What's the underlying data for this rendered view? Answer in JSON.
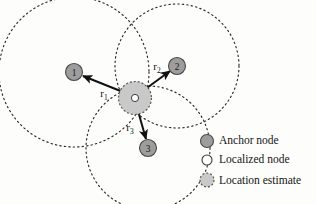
{
  "figure": {
    "background_color": "#fdfdfc"
  },
  "colors": {
    "anchor_fill": "#9d9d9d",
    "anchor_stroke": "#4a4a4a",
    "estimate_fill": "#c9c9c9",
    "estimate_stroke": "#555555",
    "localized_fill": "#ffffff",
    "localized_stroke": "#3a3a3a",
    "circle_stroke": "#2b2b2b",
    "arrow_stroke": "#111111",
    "text": "#141414"
  },
  "anchors": [
    {
      "id": "1",
      "label": "1",
      "cx": 74,
      "cy": 72,
      "r": 8.5,
      "range_circle_r": 75
    },
    {
      "id": "2",
      "label": "2",
      "cx": 177,
      "cy": 66,
      "r": 8.5,
      "range_circle_r": 62
    },
    {
      "id": "3",
      "label": "3",
      "cx": 148,
      "cy": 148,
      "r": 8.5,
      "range_circle_r": 62
    }
  ],
  "estimate": {
    "cx": 135,
    "cy": 98,
    "r": 16.5,
    "localized_r": 3.6
  },
  "range_labels": [
    {
      "base": "r",
      "sub": "1",
      "x": 104,
      "y": 97
    },
    {
      "base": "r",
      "sub": "2",
      "x": 157,
      "y": 70
    },
    {
      "base": "r",
      "sub": "3",
      "x": 130,
      "y": 131
    }
  ],
  "legend": {
    "items": [
      {
        "key": "anchor",
        "label": "Anchor node",
        "icon": "filled-gray-circle-icon",
        "cx": 207,
        "cy": 141,
        "r": 6.5,
        "text_x": 219,
        "text_y": 141
      },
      {
        "key": "localized",
        "label": "Localized node",
        "icon": "open-white-circle-icon",
        "cx": 207,
        "cy": 160,
        "r": 5.0,
        "text_x": 219,
        "text_y": 160
      },
      {
        "key": "estimate",
        "label": "Location estimate",
        "icon": "dashed-gray-circle-icon",
        "cx": 207,
        "cy": 180,
        "r": 7.0,
        "text_x": 219,
        "text_y": 181
      }
    ]
  }
}
